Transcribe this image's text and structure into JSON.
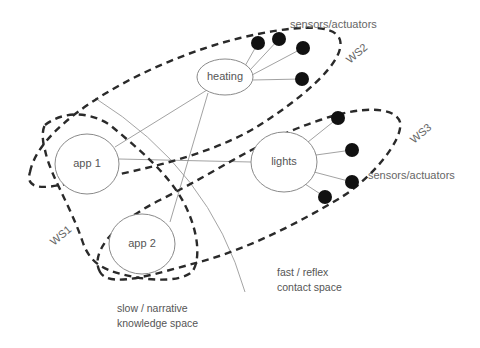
{
  "diagram": {
    "nodes": {
      "heating": {
        "label": "heating"
      },
      "lights": {
        "label": "lights"
      },
      "app1": {
        "label": "app 1"
      },
      "app2": {
        "label": "app 2"
      }
    },
    "sensor_labels": {
      "top": "sensors/actuators",
      "right": "sensors/actuators"
    },
    "workspaces": {
      "ws1": "WS1",
      "ws2": "WS2",
      "ws3": "WS3"
    },
    "regions": {
      "slow_line1": "slow / narrative",
      "slow_line2": "knowledge space",
      "fast_line1": "fast / reflex",
      "fast_line2": "contact space"
    },
    "edges": [
      [
        "app1",
        "heating"
      ],
      [
        "app1",
        "lights"
      ],
      [
        "app2",
        "heating"
      ],
      [
        "heating",
        "sensor-h1"
      ],
      [
        "heating",
        "sensor-h2"
      ],
      [
        "heating",
        "sensor-h3"
      ],
      [
        "heating",
        "sensor-h4"
      ],
      [
        "lights",
        "sensor-l1"
      ],
      [
        "lights",
        "sensor-l2"
      ],
      [
        "lights",
        "sensor-l3"
      ],
      [
        "lights",
        "sensor-l4"
      ]
    ],
    "colors": {
      "node_stroke": "#8a8a8a",
      "workspace_dash": "#2a2a2a",
      "sensor_fill": "#111111",
      "text": "#555555"
    }
  }
}
